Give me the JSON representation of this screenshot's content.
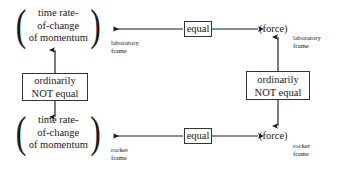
{
  "diagram": {
    "colors": {
      "background": "#ffffff",
      "ink": "#1a1a1a",
      "rule": "#333333"
    },
    "nodes": {
      "momentum_lab": {
        "line1": "time rate-",
        "line2": "of-change",
        "line3": "of momentum",
        "open_paren": "(",
        "close_paren": ")",
        "subscript_line1": "laboratory",
        "subscript_line2": "frame"
      },
      "momentum_rocket": {
        "line1": "time rate-",
        "line2": "of-change",
        "line3": "of momentum",
        "open_paren": "(",
        "close_paren": ")",
        "subscript_line1": "rocket",
        "subscript_line2": "frame"
      },
      "force_lab": {
        "label": "(force)",
        "subscript_line1": "laboratory",
        "subscript_line2": "frame"
      },
      "force_rocket": {
        "label": "(force)",
        "subscript_line1": "rocket",
        "subscript_line2": "frame"
      }
    },
    "boxes": {
      "equal_top": {
        "label": "equal"
      },
      "equal_bottom": {
        "label": "equal"
      },
      "not_equal_left": {
        "line1": "ordinarily",
        "line2": "NOT equal"
      },
      "not_equal_right": {
        "line1": "ordinarily",
        "line2": "NOT equal"
      }
    },
    "connectors": [
      {
        "name": "equal-top-to-momentum-lab",
        "direction": "left",
        "arrowheads": 1
      },
      {
        "name": "equal-top-to-force-lab",
        "direction": "right",
        "arrowheads": 1
      },
      {
        "name": "equal-bottom-to-momentum-rocket",
        "direction": "left",
        "arrowheads": 1
      },
      {
        "name": "equal-bottom-to-force-rocket",
        "direction": "right",
        "arrowheads": 1
      },
      {
        "name": "not-equal-left-to-momentum-lab",
        "direction": "up",
        "arrowheads": 1
      },
      {
        "name": "not-equal-left-to-momentum-rocket",
        "direction": "down",
        "arrowheads": 1
      },
      {
        "name": "not-equal-right-to-force-lab",
        "direction": "up",
        "arrowheads": 1
      },
      {
        "name": "not-equal-right-to-force-rocket",
        "direction": "down",
        "arrowheads": 1
      }
    ]
  }
}
